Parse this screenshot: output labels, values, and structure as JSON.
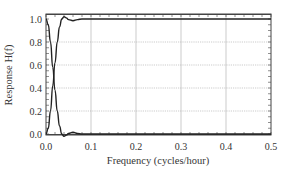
{
  "chart_data": {
    "type": "line",
    "title": "",
    "xlabel": "Frequency (cycles/hour)",
    "ylabel": "Response H(f)",
    "xlim": [
      0.0,
      0.5
    ],
    "ylim": [
      0.0,
      1.0
    ],
    "xticks": [
      "0.0",
      "0.1",
      "0.2",
      "0.3",
      "0.4",
      "0.5"
    ],
    "yticks": [
      "0.0",
      "0.2",
      "0.4",
      "0.6",
      "0.8",
      "1.0"
    ],
    "grid": true,
    "legend": null,
    "series": [
      {
        "name": "high-pass",
        "x": [
          0.0,
          0.005,
          0.01,
          0.015,
          0.02,
          0.025,
          0.03,
          0.035,
          0.04,
          0.045,
          0.05,
          0.06,
          0.07,
          0.08,
          0.1,
          0.2,
          0.3,
          0.4,
          0.5
        ],
        "values": [
          0.0,
          0.05,
          0.2,
          0.42,
          0.62,
          0.8,
          0.93,
          1.0,
          1.02,
          1.01,
          0.995,
          0.985,
          0.995,
          1.0,
          1.0,
          1.0,
          1.0,
          1.0,
          1.0
        ]
      },
      {
        "name": "low-pass",
        "x": [
          0.0,
          0.005,
          0.01,
          0.015,
          0.02,
          0.025,
          0.03,
          0.035,
          0.04,
          0.045,
          0.05,
          0.06,
          0.07,
          0.08,
          0.1,
          0.2,
          0.3,
          0.4,
          0.5
        ],
        "values": [
          1.0,
          0.95,
          0.8,
          0.58,
          0.38,
          0.2,
          0.07,
          0.0,
          -0.02,
          -0.01,
          0.005,
          0.015,
          0.005,
          0.0,
          0.0,
          0.0,
          0.0,
          0.0,
          0.0
        ]
      }
    ]
  },
  "colors": {
    "line": "#222222",
    "grid": "#aaaaaa",
    "axis": "#444444"
  }
}
